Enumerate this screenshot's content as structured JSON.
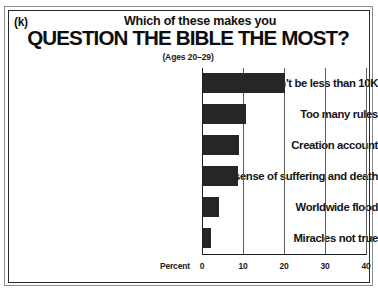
{
  "panel": {
    "letter": "(k)"
  },
  "header": {
    "supertitle": "Which of these makes you",
    "title": "QUESTION THE BIBLE THE MOST?",
    "subtitle": "(Ages 20–29)"
  },
  "axis": {
    "x_axis_label": "Percent",
    "tick_labels": [
      "0",
      "10",
      "20",
      "30",
      "40"
    ]
  },
  "colors": {
    "bar": "#262626",
    "frame": "#2a2a2a",
    "gridline": "#5d5d5d",
    "background": "#ffffff"
  },
  "chart_data": {
    "type": "bar",
    "orientation": "horizontal",
    "title": "QUESTION THE BIBLE THE MOST?",
    "subtitle": "(Ages 20–29)",
    "supertitle": "Which of these makes you",
    "panel_letter": "(k)",
    "xlabel": "Percent",
    "ylabel": "",
    "xlim": [
      0,
      40
    ],
    "xticks": [
      0,
      10,
      20,
      30,
      40
    ],
    "grid": true,
    "grid_axis": "x",
    "legend": false,
    "categories": [
      "Can't be less than 10K",
      "Too many rules",
      "Creation account",
      "No sense of suffering and death",
      "Worldwide flood",
      "Miracles not true"
    ],
    "values": [
      20.0,
      10.5,
      8.8,
      8.5,
      4.0,
      2.0
    ]
  }
}
